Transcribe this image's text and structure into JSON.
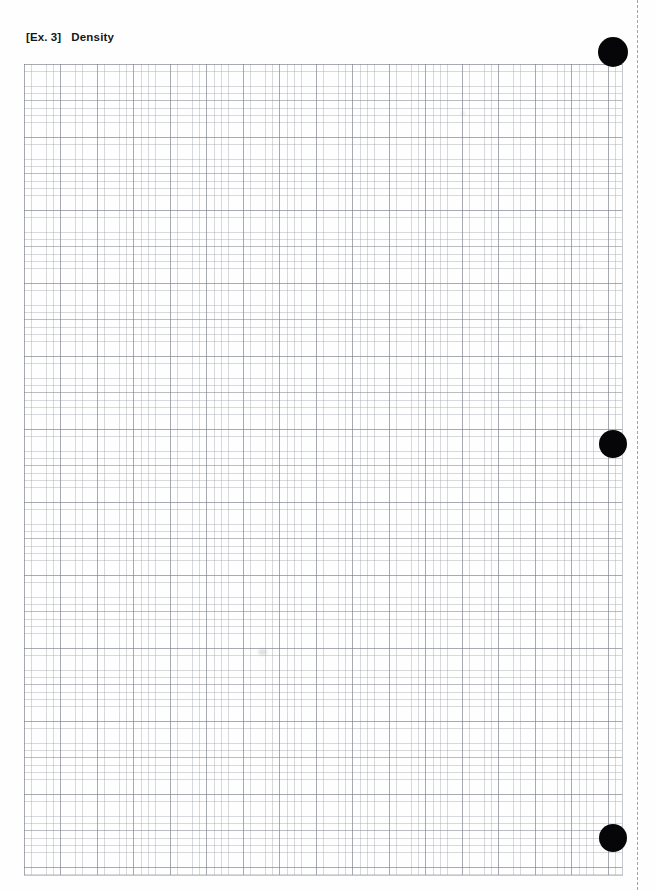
{
  "page": {
    "width": 656,
    "height": 890,
    "background_color": "#ffffff",
    "document_type": "graph-paper-worksheet-scan"
  },
  "header": {
    "exercise_tag": "[Ex. 3]",
    "title": "Density",
    "full_line": "[Ex. 3]  Density",
    "text_color": "#15161a"
  },
  "grid": {
    "label": "graph paper grid",
    "left": 24,
    "top": 64,
    "width": 598,
    "height": 811,
    "minor_cell_px": 7.3,
    "major_every_cells": 5,
    "major_cell_px": 36.5,
    "minor_line_color": "#8c919b",
    "major_line_color": "#787c86",
    "columns_minor": 82,
    "rows_minor": 111
  },
  "registration_dots": {
    "label": "black registration dots",
    "color": "#060608",
    "items": [
      {
        "name": "top-registration-dot",
        "cx": 613,
        "cy": 52,
        "r": 15
      },
      {
        "name": "middle-registration-dot",
        "cx": 613,
        "cy": 444,
        "r": 14
      },
      {
        "name": "bottom-registration-dot",
        "cx": 613,
        "cy": 838,
        "r": 14
      }
    ]
  },
  "scan_edge": {
    "label": "scan edge dashed line",
    "x": 637,
    "color": "#a0a3aa",
    "style": "dashed"
  },
  "artifacts": [
    {
      "name": "scan-smudge",
      "cx": 262,
      "cy": 652,
      "w": 9,
      "h": 6
    },
    {
      "name": "scan-speck",
      "cx": 463,
      "cy": 113,
      "w": 4,
      "h": 3
    },
    {
      "name": "scan-speck-lower",
      "cx": 580,
      "cy": 327,
      "w": 4,
      "h": 3
    }
  ]
}
